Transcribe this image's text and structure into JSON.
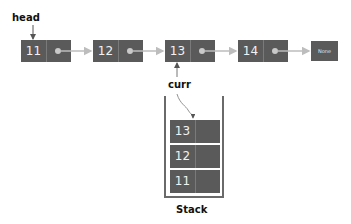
{
  "labels": {
    "head": "head",
    "curr": "curr",
    "stack": "Stack"
  },
  "linked_list": {
    "nodes": [
      {
        "value": "11"
      },
      {
        "value": "12"
      },
      {
        "value": "13"
      },
      {
        "value": "14"
      }
    ],
    "terminal": "None"
  },
  "stack": {
    "items": [
      {
        "value": "13"
      },
      {
        "value": "12"
      },
      {
        "value": "11"
      }
    ]
  },
  "colors": {
    "node_fill": "#5a5a5a",
    "arrow": "#bdbdbd",
    "text_light": "#f2f2f2"
  }
}
